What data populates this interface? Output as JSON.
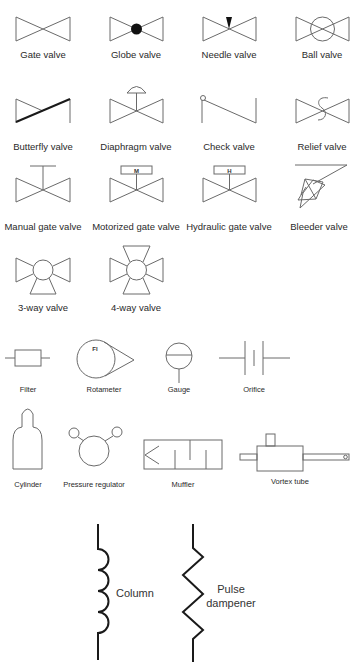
{
  "diagram": {
    "colors": {
      "line": "#6a6a6a",
      "heavy": "#1a1a1a",
      "background": "#ffffff"
    },
    "valves": [
      {
        "id": "gate",
        "label": "Gate valve"
      },
      {
        "id": "globe",
        "label": "Globe valve"
      },
      {
        "id": "needle",
        "label": "Needle valve"
      },
      {
        "id": "ball",
        "label": "Ball valve"
      },
      {
        "id": "butterfly",
        "label": "Butterfly valve"
      },
      {
        "id": "diaphragm",
        "label": "Diaphragm valve"
      },
      {
        "id": "check",
        "label": "Check valve"
      },
      {
        "id": "relief",
        "label": "Relief valve"
      },
      {
        "id": "manual-gate",
        "label": "Manual gate valve"
      },
      {
        "id": "motorized-gate",
        "label": "Motorized gate valve",
        "actuator_letter": "M"
      },
      {
        "id": "hydraulic-gate",
        "label": "Hydraulic gate valve",
        "actuator_letter": "H"
      },
      {
        "id": "bleeder",
        "label": "Bleeder valve"
      },
      {
        "id": "three-way",
        "label": "3-way valve"
      },
      {
        "id": "four-way",
        "label": "4-way valve"
      }
    ],
    "instruments": [
      {
        "id": "filter",
        "label": "Filter"
      },
      {
        "id": "rotameter",
        "label": "Rotameter",
        "tag": "FI"
      },
      {
        "id": "gauge",
        "label": "Gauge"
      },
      {
        "id": "orifice",
        "label": "Orifice"
      }
    ],
    "equipment": [
      {
        "id": "cylinder",
        "label": "Cylinder"
      },
      {
        "id": "pressure-regulator",
        "label": "Pressure regulator"
      },
      {
        "id": "muffler",
        "label": "Muffler"
      },
      {
        "id": "vortex-tube",
        "label": "Vortex tube"
      }
    ],
    "large": [
      {
        "id": "column",
        "label": "Column"
      },
      {
        "id": "pulse-dampener",
        "label_line1": "Pulse",
        "label_line2": "dampener"
      }
    ]
  }
}
